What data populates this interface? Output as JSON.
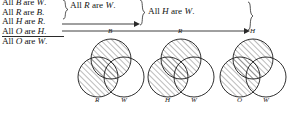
{
  "figure": {
    "premises": [
      {
        "id": "p1",
        "text": "All B are W.",
        "subject": "B",
        "predicate": "W"
      },
      {
        "id": "p2",
        "text": "All R are B.",
        "subject": "R",
        "predicate": "B"
      },
      {
        "id": "p3",
        "text": "All H are R.",
        "subject": "H",
        "predicate": "R"
      },
      {
        "id": "p4",
        "text": "All O are H.",
        "subject": "O",
        "predicate": "H"
      }
    ],
    "final_conclusion": {
      "id": "c0",
      "text": "All O are W.",
      "subject": "O",
      "predicate": "W"
    },
    "intermediate_conclusions": [
      {
        "id": "c1",
        "text": "All R are W.",
        "subject": "R",
        "predicate": "W"
      },
      {
        "id": "c2",
        "text": "All H are W.",
        "subject": "H",
        "predicate": "W"
      }
    ],
    "line_color": "#2a2a2a",
    "hatch_color": "#555555",
    "circle_color": "#1a1a1a"
  },
  "venn_diagrams": [
    {
      "id": "venn-1",
      "caption": "B, R, W",
      "circles": [
        {
          "label": "B",
          "position": "top",
          "shaded": true
        },
        {
          "label": "R",
          "position": "bottom-left",
          "shaded": true
        },
        {
          "label": "W",
          "position": "bottom-right",
          "shaded": false
        }
      ]
    },
    {
      "id": "venn-2",
      "caption": "R, H, W",
      "circles": [
        {
          "label": "R",
          "position": "top",
          "shaded": true
        },
        {
          "label": "H",
          "position": "bottom-left",
          "shaded": true
        },
        {
          "label": "W",
          "position": "bottom-right",
          "shaded": false
        }
      ]
    },
    {
      "id": "venn-3",
      "caption": "H, O, W",
      "circles": [
        {
          "label": "H",
          "position": "top",
          "shaded": true
        },
        {
          "label": "O",
          "position": "bottom-left",
          "shaded": true
        },
        {
          "label": "W",
          "position": "bottom-right",
          "shaded": false
        }
      ]
    }
  ]
}
